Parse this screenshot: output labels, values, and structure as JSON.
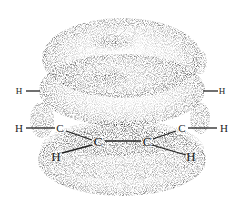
{
  "figure": {
    "atoms": [
      {
        "id": "h-top-left",
        "label": "H",
        "x": 19,
        "y": 94,
        "size": 9
      },
      {
        "id": "h-top-right",
        "label": "H",
        "x": 222,
        "y": 94,
        "size": 9
      },
      {
        "id": "h-mid-left",
        "label": "H",
        "x": 19,
        "y": 132,
        "size": 11
      },
      {
        "id": "c-left",
        "label": "C",
        "x": 60,
        "y": 132,
        "size": 11
      },
      {
        "id": "c-right",
        "label": "C",
        "x": 182,
        "y": 132,
        "size": 11
      },
      {
        "id": "h-mid-right",
        "label": "H",
        "x": 224,
        "y": 132,
        "size": 11
      },
      {
        "id": "c-center-left",
        "label": "C",
        "x": 98,
        "y": 146,
        "size": 13
      },
      {
        "id": "c-center-right",
        "label": "C",
        "x": 147,
        "y": 146,
        "size": 13
      },
      {
        "id": "h-bottom-left",
        "label": "H",
        "x": 56,
        "y": 161,
        "size": 13
      },
      {
        "id": "h-bottom-right",
        "label": "H",
        "x": 191,
        "y": 161,
        "size": 13
      }
    ],
    "colors": {
      "stipple": "#555555",
      "ink": "#222222",
      "background": "#ffffff"
    }
  }
}
